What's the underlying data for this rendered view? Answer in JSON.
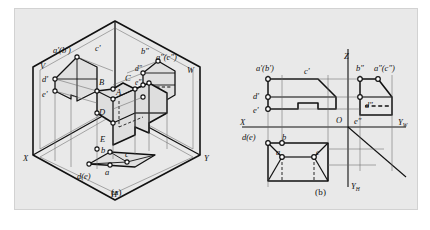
{
  "figure": {
    "kind": "descriptive-geometry-projection-figure",
    "background_color": "#e9e9e9",
    "page_color": "#ffffff",
    "line_color": "#111111",
    "captions": {
      "a": "(a)",
      "b": "(b)"
    }
  },
  "panel_a": {
    "title": "isometric view in three projection planes",
    "plane_labels": {
      "v": "V",
      "w": "W",
      "h": "H"
    },
    "axis_labels": {
      "x": "X",
      "y": "Y"
    },
    "front_view_labels": {
      "ab": "a'(b')",
      "c": "c'",
      "d": "d'",
      "e": "e'"
    },
    "side_view_labels": {
      "b": "b″",
      "ac": "a″(c″)",
      "d": "d″",
      "e": "e″"
    },
    "top_view_labels": {
      "b": "b",
      "c": "c",
      "a": "a",
      "de": "d(e)"
    },
    "solid_vertex_labels": {
      "a": "A",
      "b": "B",
      "c": "C",
      "d": "D",
      "e": "E"
    }
  },
  "panel_b": {
    "title": "orthographic three-view projection",
    "axis_labels": {
      "z": "Z",
      "x": "X",
      "origin": "O",
      "yw": "Y",
      "yw_sub": "W",
      "yh": "Y",
      "yh_sub": "H"
    },
    "front_view_labels": {
      "ab": "a'(b')",
      "c": "c'",
      "d": "d'",
      "e": "e'"
    },
    "side_view_labels": {
      "b": "b″",
      "ac": "a″(c″)",
      "d": "d″",
      "e": "e″"
    },
    "top_view_labels": {
      "de": "d(e)",
      "b": "b",
      "a": "a",
      "c": "c"
    }
  }
}
